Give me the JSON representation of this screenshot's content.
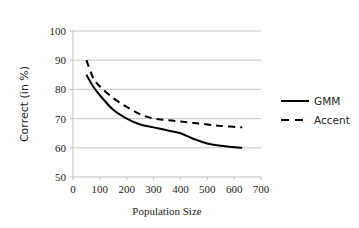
{
  "chart_data": {
    "type": "line",
    "title": "",
    "xlabel": "Population Size",
    "ylabel": "Correct (in %)",
    "xlim": [
      0,
      700
    ],
    "ylim": [
      50,
      100
    ],
    "x_ticks": [
      0,
      100,
      200,
      300,
      400,
      500,
      600,
      700
    ],
    "y_ticks": [
      50,
      60,
      70,
      80,
      90,
      100
    ],
    "grid": "horizontal",
    "legend_position": "right",
    "series": [
      {
        "name": "GMM",
        "style": "solid",
        "color": "#000000",
        "x": [
          50,
          75,
          100,
          150,
          200,
          250,
          300,
          350,
          400,
          450,
          500,
          550,
          630
        ],
        "y": [
          85,
          81,
          78,
          73,
          70,
          68,
          67,
          66,
          65,
          63,
          61.5,
          60.7,
          60
        ]
      },
      {
        "name": "Accent",
        "style": "dashed",
        "color": "#000000",
        "x": [
          50,
          75,
          100,
          150,
          200,
          250,
          300,
          350,
          400,
          450,
          500,
          550,
          630
        ],
        "y": [
          90,
          84,
          81,
          77,
          74,
          71.5,
          70,
          69.5,
          69,
          68.5,
          68,
          67.5,
          67
        ]
      }
    ]
  }
}
